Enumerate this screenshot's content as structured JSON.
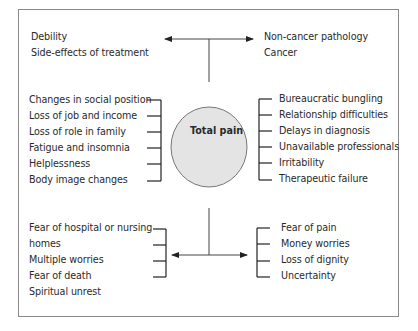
{
  "diagram": {
    "center": {
      "label": "Total pain",
      "fill": "#e4e4e4",
      "stroke": "#777777"
    },
    "top_left": [
      "Debility",
      "Side-effects of treatment"
    ],
    "top_right": [
      "Non-cancer pathology",
      "Cancer"
    ],
    "middle_left": [
      "Changes in social position",
      "Loss of job and income",
      "Loss of role in family",
      "Fatigue and insomnia",
      "Helplessness",
      "Body image changes"
    ],
    "middle_right": [
      "Bureaucratic bungling",
      "Relationship difficulties",
      "Delays in diagnosis",
      "Unavailable professionals",
      "Irritability",
      "Therapeutic failure"
    ],
    "bottom_left": [
      "Fear of hospital or nursing",
      "homes",
      "Multiple worries",
      "Fear of death",
      "Spiritual unrest"
    ],
    "bottom_right": [
      "Fear of pain",
      "Money worries",
      "Loss of dignity",
      "Uncertainty"
    ]
  }
}
